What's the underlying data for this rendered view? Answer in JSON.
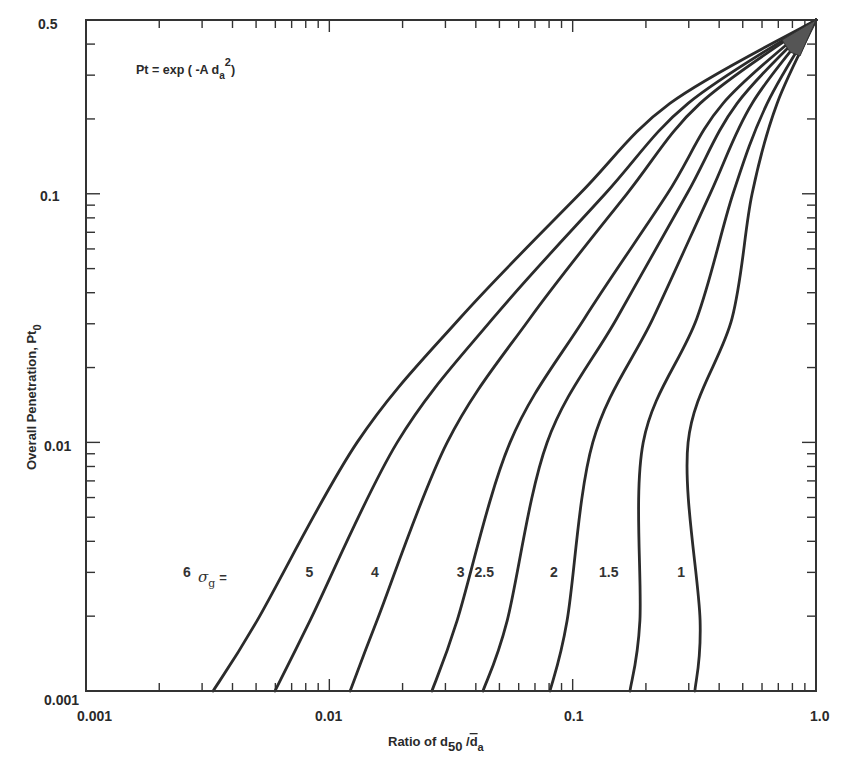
{
  "chart_data": {
    "type": "line",
    "title": "",
    "annotation": {
      "equation_prefix": "Pt = exp ( -A d",
      "equation_sub": "a",
      "equation_sup": "2",
      "equation_suffix": ")"
    },
    "xlabel": {
      "prefix": "Ratio of d",
      "sub1": "50",
      "mid": " /",
      "bar": "d",
      "sub2": "a"
    },
    "ylabel": {
      "text": "Overall Penetration, Pt",
      "sub": "0"
    },
    "xscale": "log",
    "yscale": "log",
    "xlim": [
      0.001,
      1.0
    ],
    "ylim": [
      0.001,
      0.5
    ],
    "grid": false,
    "x_tick_labels": [
      "0.001",
      "0.01",
      "0.1",
      "1.0"
    ],
    "x_ticks": [
      0.001,
      0.01,
      0.1,
      1.0
    ],
    "y_tick_labels": [
      "0.001",
      "0.01",
      "0.1",
      "0.5"
    ],
    "y_ticks": [
      0.001,
      0.01,
      0.1,
      0.5
    ],
    "legend_prefix": "σ",
    "legend_prefix_sub": "g",
    "legend_eq": "=",
    "y_levels": [
      0.001,
      0.00192,
      0.01,
      0.0316,
      0.1,
      0.231,
      0.5
    ],
    "series": [
      {
        "name": "6",
        "label_x": 0.0027,
        "x": [
          0.00333,
          0.00505,
          0.013,
          0.0344,
          0.107,
          0.251,
          1.0
        ]
      },
      {
        "name": "5",
        "label_x": 0.0086,
        "x": [
          0.00598,
          0.00833,
          0.019,
          0.0471,
          0.136,
          0.298,
          1.0
        ]
      },
      {
        "name": "4",
        "label_x": 0.016,
        "x": [
          0.01217,
          0.0157,
          0.0305,
          0.0668,
          0.167,
          0.334,
          1.0
        ]
      },
      {
        "name": "3",
        "label_x": 0.036,
        "x": [
          0.0264,
          0.0335,
          0.0553,
          0.112,
          0.245,
          0.415,
          1.0
        ]
      },
      {
        "name": "2.5",
        "label_x": 0.045,
        "x": [
          0.0428,
          0.0538,
          0.0785,
          0.152,
          0.295,
          0.474,
          1.0
        ]
      },
      {
        "name": "2",
        "label_x": 0.087,
        "x": [
          0.0807,
          0.0949,
          0.121,
          0.214,
          0.367,
          0.546,
          1.0
        ]
      },
      {
        "name": "1.5",
        "label_x": 0.146,
        "x": [
          0.172,
          0.189,
          0.195,
          0.324,
          0.456,
          0.63,
          1.0
        ]
      },
      {
        "name": "1",
        "label_x": 0.29,
        "x": [
          0.318,
          0.334,
          0.298,
          0.452,
          0.546,
          0.692,
          1.0
        ]
      }
    ],
    "curve_label_y": 0.003,
    "line_color": "#2b2b2b",
    "axis_color": "#333333"
  }
}
